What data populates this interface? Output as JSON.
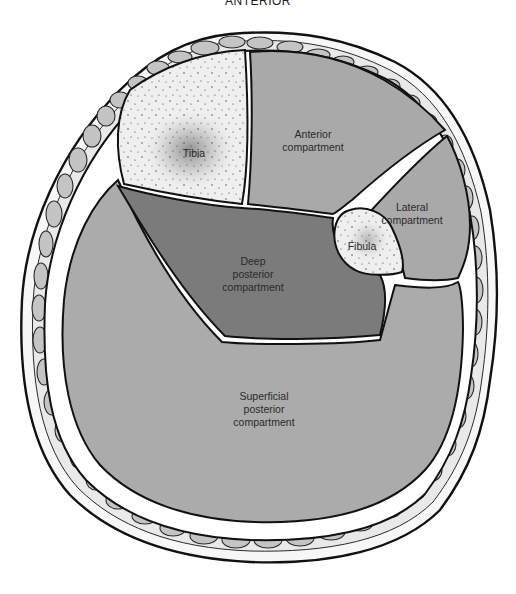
{
  "figure": {
    "title": "ANTERIOR",
    "structures": {
      "tibia": {
        "label": "Tibia",
        "fill": "#efefef"
      },
      "fibula": {
        "label": "Fibula",
        "fill": "#efefef"
      },
      "anterior": {
        "label_line1": "Anterior",
        "label_line2": "compartment",
        "fill": "#a9a9a9"
      },
      "lateral": {
        "label_line1": "Lateral",
        "label_line2": "compartment",
        "fill": "#a9a9a9"
      },
      "deep_posterior": {
        "label_line1": "Deep",
        "label_line2": "posterior",
        "label_line3": "compartment",
        "fill": "#7b7b7b"
      },
      "superficial_posterior": {
        "label_line1": "Superficial",
        "label_line2": "posterior",
        "label_line3": "compartment",
        "fill": "#ababab"
      }
    },
    "colors": {
      "fat_cell": "#c4c4c4",
      "outline": "#111111",
      "background": "#ffffff"
    }
  }
}
